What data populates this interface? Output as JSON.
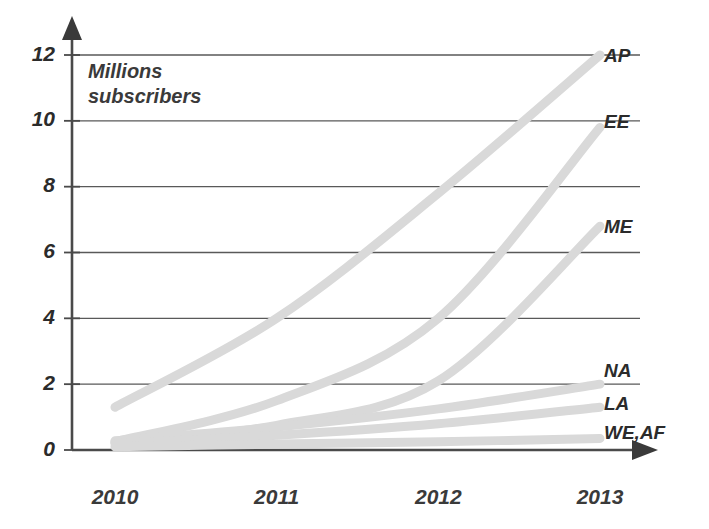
{
  "chart_data": {
    "type": "line",
    "title": "",
    "subtitle": "",
    "xlabel": "",
    "ylabel": "Millions subscribers",
    "ylabel_line1": "Millions",
    "ylabel_line2": "subscribers",
    "x": [
      2010,
      2011,
      2012,
      2013
    ],
    "xtick_labels": [
      "2010",
      "2011",
      "2012",
      "2013"
    ],
    "ytick_labels": [
      "0",
      "2",
      "4",
      "6",
      "8",
      "10",
      "12"
    ],
    "ytick_values": [
      0,
      2,
      4,
      6,
      8,
      10,
      12
    ],
    "xlim": [
      2010,
      2013
    ],
    "ylim": [
      0,
      12
    ],
    "grid": "horizontal",
    "legend_position": "right-of-line-ends",
    "series_color": "#d9d9d9",
    "axis_color": "#4a4a4a",
    "grid_color": "#595959",
    "text_color": "#2b2b2b",
    "series": [
      {
        "name": "AP",
        "label": "AP",
        "values": [
          1.3,
          4.0,
          7.8,
          12.0
        ]
      },
      {
        "name": "EE",
        "label": "EE",
        "values": [
          0.25,
          1.5,
          4.0,
          9.8
        ]
      },
      {
        "name": "ME",
        "label": "ME",
        "values": [
          0.22,
          0.75,
          2.1,
          6.8
        ]
      },
      {
        "name": "NA",
        "label": "NA",
        "values": [
          0.28,
          0.7,
          1.25,
          2.0
        ]
      },
      {
        "name": "LA",
        "label": "LA",
        "values": [
          0.2,
          0.45,
          0.8,
          1.3
        ]
      },
      {
        "name": "WE,AF",
        "label": "WE,AF",
        "values": [
          0.1,
          0.18,
          0.25,
          0.35
        ]
      }
    ]
  }
}
